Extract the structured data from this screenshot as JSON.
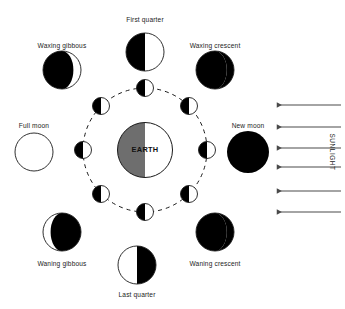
{
  "diagram": {
    "center_body": {
      "name": "EARTH",
      "label": "EARTH",
      "cx": 145,
      "cy": 150,
      "r": 27.5,
      "shadow_color": "#6e6e6e",
      "lit_color": "#ffffff",
      "outline_color": "#1a1a1a"
    },
    "orbit": {
      "cx": 145,
      "cy": 150,
      "r": 62,
      "style": "dashed",
      "dash": "4 4",
      "stroke": "#1a1a1a",
      "stroke_width": 1
    },
    "colors": {
      "dark": "#000000",
      "light": "#ffffff",
      "outline": "#1a1a1a",
      "earth_shadow": "#6e6e6e",
      "arrow": "#4a4a4a",
      "text": "#1c1c1c"
    },
    "orbit_moons": [
      {
        "name": "orbit-moon-top",
        "cx": 145,
        "cy": 88,
        "r": 8.5,
        "dark_side": "left"
      },
      {
        "name": "orbit-moon-top-right",
        "cx": 189,
        "cy": 106,
        "r": 8.5,
        "dark_side": "left"
      },
      {
        "name": "orbit-moon-right",
        "cx": 207,
        "cy": 150,
        "r": 8.5,
        "dark_side": "left"
      },
      {
        "name": "orbit-moon-bottom-right",
        "cx": 189,
        "cy": 194,
        "r": 8.5,
        "dark_side": "left"
      },
      {
        "name": "orbit-moon-bottom",
        "cx": 145,
        "cy": 212,
        "r": 8.5,
        "dark_side": "left"
      },
      {
        "name": "orbit-moon-bottom-left",
        "cx": 101,
        "cy": 194,
        "r": 8.5,
        "dark_side": "left"
      },
      {
        "name": "orbit-moon-left",
        "cx": 83,
        "cy": 150,
        "r": 8.5,
        "dark_side": "left"
      },
      {
        "name": "orbit-moon-top-left",
        "cx": 101,
        "cy": 106,
        "r": 8.5,
        "dark_side": "left"
      }
    ],
    "phases": [
      {
        "name": "first-quarter",
        "label": "First quarter",
        "cx": 145,
        "cy": 52,
        "r": 19,
        "phase": "half-left-dark",
        "label_x": 145,
        "label_y": 17
      },
      {
        "name": "waxing-crescent",
        "label": "Waxing crescent",
        "cx": 215,
        "cy": 70,
        "r": 19,
        "phase": "crescent-right-lit",
        "label_x": 215,
        "label_y": 43
      },
      {
        "name": "new-moon",
        "label": "New moon",
        "cx": 248,
        "cy": 152,
        "r": 21,
        "phase": "full-dark",
        "label_x": 248,
        "label_y": 123
      },
      {
        "name": "waning-crescent",
        "label": "Waning crescent",
        "cx": 215,
        "cy": 232,
        "r": 19,
        "phase": "crescent-right-lit",
        "label_x": 215,
        "label_y": 261
      },
      {
        "name": "last-quarter",
        "label": "Last quarter",
        "cx": 137,
        "cy": 265,
        "r": 19,
        "phase": "half-right-dark",
        "label_x": 137,
        "label_y": 292
      },
      {
        "name": "waning-gibbous",
        "label": "Waning gibbous",
        "cx": 62,
        "cy": 232,
        "r": 19,
        "phase": "gibbous-right-dark",
        "label_x": 62,
        "label_y": 261
      },
      {
        "name": "full-moon",
        "label": "Full moon",
        "cx": 34,
        "cy": 152,
        "r": 19,
        "phase": "full-light",
        "label_x": 34,
        "label_y": 123
      },
      {
        "name": "waxing-gibbous",
        "label": "Waxing gibbous",
        "cx": 62,
        "cy": 70,
        "r": 19,
        "phase": "gibbous-left-dark",
        "label_x": 62,
        "label_y": 43
      }
    ],
    "sunlight": {
      "label": "SUNLIGHT",
      "label_x": 332,
      "label_y": 152,
      "direction": "right-to-left",
      "arrow_count": 6,
      "arrow_x_start": 341,
      "arrow_x_end": 277,
      "arrows_y": [
        105,
        127,
        148,
        167,
        191,
        212
      ]
    }
  }
}
